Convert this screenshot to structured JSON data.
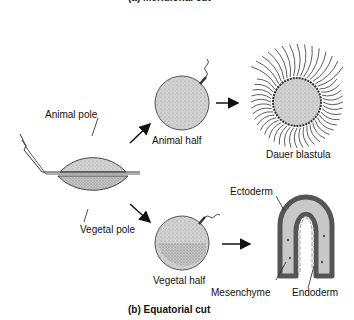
{
  "figure": {
    "top_caption_cropped": "(a) Meridional cut",
    "bottom_caption": "(b) Equatorial cut"
  },
  "labels": {
    "animal_pole": "Animal pole",
    "vegetal_pole": "Vegetal pole",
    "animal_half": "Animal half",
    "vegetal_half": "Vegetal half",
    "dauer_blastula": "Dauer blastula",
    "ectoderm": "Ectoderm",
    "mesenchyme": "Mesenchyme",
    "endoderm": "Endoderm"
  },
  "colors": {
    "animal_fill": "#cfcfcf",
    "vegetal_fill": "#bdbdbd",
    "outline": "#333333",
    "ectoderm_cells": "#6e6e6e",
    "line": "#111111"
  }
}
